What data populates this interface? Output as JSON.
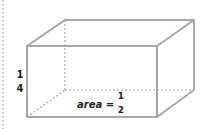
{
  "diagram": {
    "type": "rectangular-prism",
    "height_label": {
      "numerator": "1",
      "denominator": "4"
    },
    "base_label": {
      "text": "area =",
      "numerator": "1",
      "denominator": "2"
    },
    "colors": {
      "edge": "#a6a6a6",
      "hidden_edge": "#a6a6a6",
      "text": "#222222",
      "margin_dots": "#b0b0b0"
    }
  }
}
